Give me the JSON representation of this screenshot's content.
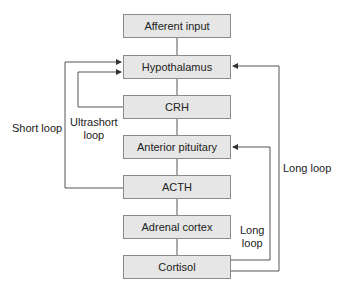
{
  "top_cutoff_text": "clocks / paging",
  "boxes": [
    {
      "id": "afferent",
      "label": "Afferent input"
    },
    {
      "id": "hypothalamus",
      "label": "Hypothalamus"
    },
    {
      "id": "crh",
      "label": "CRH"
    },
    {
      "id": "anterior_pituitary",
      "label": "Anterior pituitary"
    },
    {
      "id": "acth",
      "label": "ACTH"
    },
    {
      "id": "adrenal_cortex",
      "label": "Adrenal cortex"
    },
    {
      "id": "cortisol",
      "label": "Cortisol"
    }
  ],
  "loops": {
    "short": "Short loop",
    "ultrashort_line1": "Ultrashort",
    "ultrashort_line2": "loop",
    "long_outer": "Long loop",
    "long_inner_line1": "Long",
    "long_inner_line2": "loop"
  },
  "colors": {
    "box_fill": "#e6e6e6",
    "box_border": "#8a8a8a",
    "line": "#555555"
  }
}
